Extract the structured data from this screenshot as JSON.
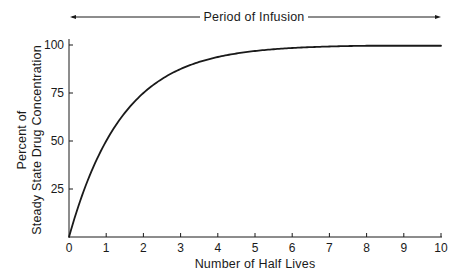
{
  "chart_data": {
    "type": "line",
    "title": "",
    "annotation": "Period of Infusion",
    "xlabel": "Number of Half Lives",
    "ylabel_line1": "Percent of",
    "ylabel_line2": "Steady State Drug Concentration",
    "xlim": [
      0,
      10
    ],
    "ylim": [
      0,
      100
    ],
    "x_ticks": [
      "0",
      "1",
      "2",
      "3",
      "4",
      "5",
      "6",
      "7",
      "8",
      "9",
      "10"
    ],
    "y_ticks": [
      "25",
      "50",
      "75",
      "100"
    ],
    "grid": false,
    "legend": null,
    "series": [
      {
        "name": "Steady State Drug Concentration",
        "x": [
          0,
          0.5,
          1,
          1.5,
          2,
          2.5,
          3,
          3.5,
          4,
          4.5,
          5,
          6,
          7,
          8,
          9,
          10
        ],
        "values": [
          0,
          29.3,
          50,
          64.6,
          75,
          82.3,
          87.5,
          91.2,
          93.8,
          95.6,
          96.9,
          98.4,
          99.2,
          99.6,
          99.8,
          99.9
        ]
      }
    ]
  }
}
